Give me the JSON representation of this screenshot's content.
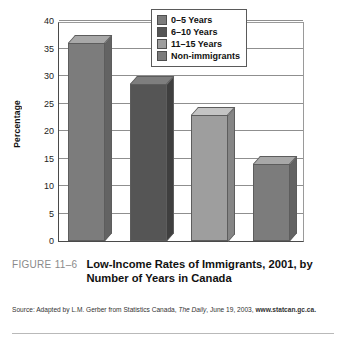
{
  "figure": {
    "number_label": "FIGURE 11–6",
    "title": "Low-Income Rates of Immigrants, 2001, by Number of Years in Canada"
  },
  "source": {
    "prefix": "Source: Adapted by L.M. Gerber from Statistics Canada, ",
    "italic": "The Daily",
    "middle": ", June 19, 2003, ",
    "url": "www.statcan.gc.ca."
  },
  "chart_data": {
    "type": "bar",
    "title": "",
    "xlabel": "",
    "ylabel": "Percentage",
    "ylim": [
      0,
      40
    ],
    "ytick_step": 5,
    "yticks": [
      "0",
      "5",
      "10",
      "15",
      "20",
      "25",
      "30",
      "35",
      "40"
    ],
    "grid": true,
    "legend_position": "top-right",
    "categories": [
      "0–5 Years",
      "6–10 Years",
      "11–15 Years",
      "Non-immigrants"
    ],
    "values": [
      36,
      28.5,
      23,
      14
    ],
    "colors": [
      "#7c7c7c",
      "#555555",
      "#9e9e9e",
      "#7c7c7c"
    ],
    "top_face_colors": [
      "#a8a8a8",
      "#7e7e7e",
      "#c4c4c4",
      "#a8a8a8"
    ],
    "side_face_colors": [
      "#636363",
      "#3f3f3f",
      "#858585",
      "#636363"
    ],
    "series": [
      {
        "name": "Low-Income Rate",
        "values": [
          36,
          28.5,
          23,
          14
        ]
      }
    ],
    "legend": [
      {
        "label": "0–5 Years",
        "color": "#7c7c7c"
      },
      {
        "label": "6–10 Years",
        "color": "#555555"
      },
      {
        "label": "11–15 Years",
        "color": "#9e9e9e"
      },
      {
        "label": "Non-immigrants",
        "color": "#7c7c7c"
      }
    ]
  }
}
